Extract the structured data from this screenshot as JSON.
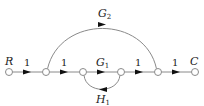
{
  "diagram": {
    "type": "signal-flow-graph",
    "nodes": [
      {
        "id": "n0",
        "label": "R",
        "x": 9
      },
      {
        "id": "n1",
        "label": "",
        "x": 46
      },
      {
        "id": "n2",
        "label": "",
        "x": 83
      },
      {
        "id": "n3",
        "label": "",
        "x": 121
      },
      {
        "id": "n4",
        "label": "",
        "x": 158
      },
      {
        "id": "n5",
        "label": "C",
        "x": 195
      }
    ],
    "branches": [
      {
        "from": "n0",
        "to": "n1",
        "gain": "1"
      },
      {
        "from": "n1",
        "to": "n2",
        "gain": "1"
      },
      {
        "from": "n2",
        "to": "n3",
        "gain_main": "G",
        "gain_sub": "1"
      },
      {
        "from": "n3",
        "to": "n4",
        "gain": "1"
      },
      {
        "from": "n4",
        "to": "n5",
        "gain": "1"
      },
      {
        "from": "n1",
        "to": "n4",
        "gain_main": "G",
        "gain_sub": "2",
        "shape": "arc-above"
      },
      {
        "from": "n3",
        "to": "n2",
        "gain_main": "H",
        "gain_sub": "1",
        "shape": "loop-below"
      }
    ],
    "labels": {
      "input": "R",
      "output": "C",
      "g1_main": "G",
      "g1_sub": "1",
      "g2_main": "G",
      "g2_sub": "2",
      "h1_main": "H",
      "h1_sub": "1",
      "unity": "1"
    },
    "colors": {
      "line": "#8a8a8a",
      "arrow": "#111111",
      "node_fill": "#ffffff",
      "node_stroke": "#8a8a8a"
    }
  }
}
